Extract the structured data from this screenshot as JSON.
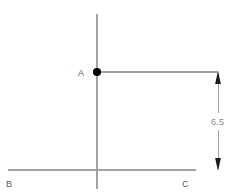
{
  "figure": {
    "type": "geometry-diagram",
    "background_color": "#ffffff",
    "line_color": "#a3a3a3",
    "point_color": "#000000",
    "label_color": "#5a5a5a",
    "dimension_label_color": "#8a8a8a",
    "width": 232,
    "height": 196
  },
  "labels": {
    "point_a": "A",
    "point_b": "B",
    "point_c": "C"
  },
  "dimension": {
    "value": "6.5",
    "orientation": "vertical",
    "arrowheads": "both"
  },
  "points": [
    {
      "name": "A",
      "x": 97,
      "y": 72
    }
  ],
  "segments": [
    {
      "name": "vertical-axis",
      "x1": 97,
      "y1": 14,
      "x2": 97,
      "y2": 189
    },
    {
      "name": "horizontal-base-bc",
      "x1": 8,
      "y1": 170,
      "x2": 196,
      "y2": 170
    },
    {
      "name": "horizontal-ray-from-a",
      "x1": 97,
      "y1": 72,
      "x2": 218,
      "y2": 72
    },
    {
      "name": "dimension-line",
      "x1": 218,
      "y1": 72,
      "x2": 218,
      "y2": 170
    }
  ]
}
